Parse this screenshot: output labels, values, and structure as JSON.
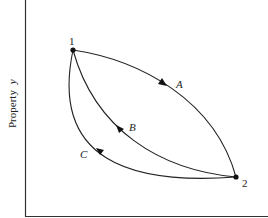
{
  "diagram": {
    "type": "property-process-diagram",
    "y_axis_label": "Property",
    "y_axis_variable": "y",
    "x_axis_label": "",
    "states": [
      {
        "id": "1",
        "label": "1",
        "x": 73,
        "y": 50
      },
      {
        "id": "2",
        "label": "2",
        "x": 236,
        "y": 177
      }
    ],
    "processes": [
      {
        "id": "A",
        "label": "A",
        "from": "1",
        "to": "2",
        "shape": "upper-right bulge"
      },
      {
        "id": "B",
        "label": "B",
        "from": "2",
        "to": "1",
        "shape": "middle curve"
      },
      {
        "id": "C",
        "label": "C",
        "from": "2",
        "to": "1",
        "shape": "lower-left bulge"
      }
    ],
    "colors": {
      "line": "#222222",
      "background": "#ffffff"
    }
  }
}
